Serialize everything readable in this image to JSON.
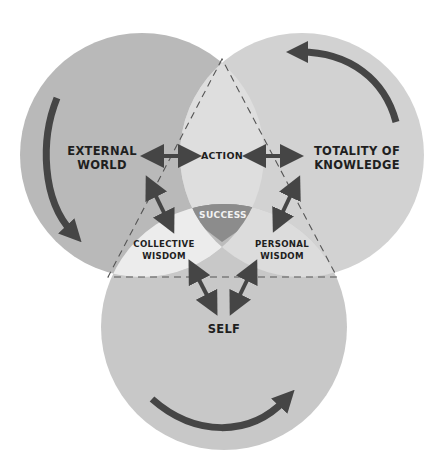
{
  "diagram": {
    "circles": {
      "left": {
        "label_line1": "EXTERNAL",
        "label_line2": "WORLD"
      },
      "right": {
        "label_line1": "TOTALITY OF",
        "label_line2": "KNOWLEDGE"
      },
      "bottom": {
        "label": "SELF"
      }
    },
    "overlaps": {
      "top": {
        "label": "ACTION"
      },
      "left_bottom": {
        "label_line1": "COLLECTIVE",
        "label_line2": "WISDOM"
      },
      "right_bottom": {
        "label_line1": "PERSONAL",
        "label_line2": "WISDOM"
      },
      "center": {
        "label": "SUCCESS"
      }
    },
    "colors": {
      "left_circle": "#b9b9b9",
      "right_circle": "#d2d2d2",
      "bottom_circle": "#c8c8c8",
      "action_lens": "#dedede",
      "collective_lens": "#ececec",
      "personal_lens": "#dcdcdc",
      "success": "#8c8c8c",
      "lower_wedge": "#bcbcbc",
      "arrow": "#454545",
      "dashed_triangle": "#555555"
    }
  }
}
